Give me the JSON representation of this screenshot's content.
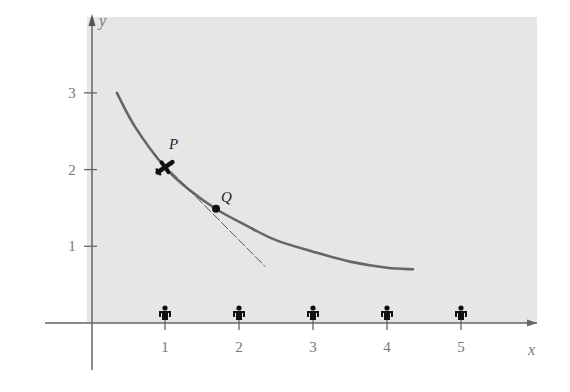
{
  "chart_data": {
    "type": "line",
    "title": "",
    "xlabel": "x",
    "ylabel": "y",
    "xlim": [
      -0.6,
      5.9
    ],
    "ylim": [
      -0.6,
      3.9
    ],
    "grid": false,
    "background_color": "#e6e6e6",
    "x_ticks": [
      1,
      2,
      3,
      4,
      5
    ],
    "x_tick_labels": [
      "1",
      "2",
      "3",
      "4",
      "5"
    ],
    "y_ticks": [
      1,
      2,
      3
    ],
    "y_tick_labels": [
      "1",
      "2",
      "3"
    ],
    "series": [
      {
        "name": "curve",
        "style": "solid",
        "color": "#666666",
        "x": [
          0.35,
          0.6,
          1.0,
          1.35,
          1.7,
          2.1,
          2.5,
          3.0,
          3.5,
          4.0,
          4.35
        ],
        "y": [
          3.0,
          2.55,
          2.03,
          1.72,
          1.48,
          1.27,
          1.08,
          0.93,
          0.8,
          0.72,
          0.7
        ]
      },
      {
        "name": "tangent at P",
        "style": "dashed",
        "color": "#555555",
        "x": [
          0.85,
          2.35
        ],
        "y": [
          2.2,
          0.74
        ]
      }
    ],
    "points": [
      {
        "label": "P",
        "x": 1.0,
        "y": 2.03,
        "marker": "airplane"
      },
      {
        "label": "Q",
        "x": 1.69,
        "y": 1.49,
        "marker": "dot"
      }
    ],
    "x_axis_markers": {
      "marker": "person",
      "x": [
        1,
        2,
        3,
        4,
        5
      ]
    }
  }
}
